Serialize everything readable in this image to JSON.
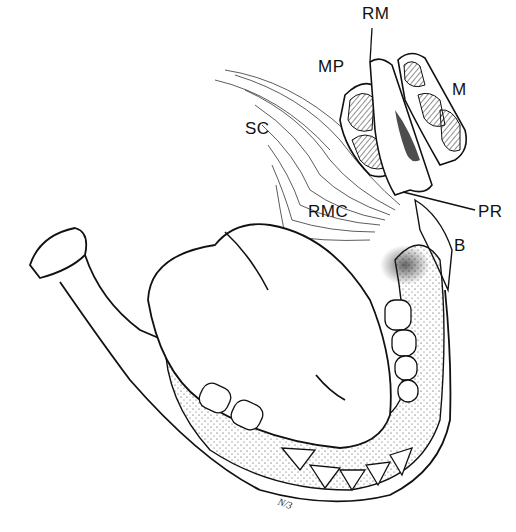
{
  "figure": {
    "type": "anatomical-line-drawing",
    "labels": [
      {
        "id": "RM",
        "text": "RM",
        "x": 362,
        "y": 5
      },
      {
        "id": "MP",
        "text": "MP",
        "x": 318,
        "y": 58
      },
      {
        "id": "M",
        "text": "M",
        "x": 452,
        "y": 81
      },
      {
        "id": "SC",
        "text": "SC",
        "x": 245,
        "y": 120
      },
      {
        "id": "RMC",
        "text": "RMC",
        "x": 308,
        "y": 203
      },
      {
        "id": "PR",
        "text": "PR",
        "x": 478,
        "y": 203
      },
      {
        "id": "B",
        "text": "B",
        "x": 454,
        "y": 237
      }
    ],
    "signature": {
      "text": "N/3",
      "x": 278,
      "y": 498
    }
  }
}
